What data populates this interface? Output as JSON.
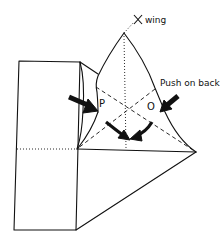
{
  "diagram": {
    "labels": {
      "x_wing": "X wing",
      "push_on_back": "Push on back",
      "point_p": "P",
      "point_o": "O"
    },
    "line_styles": {
      "solid": "edge",
      "dashed": "valley fold",
      "dotted": "crease / hidden edge"
    },
    "colors": {
      "ink": "#111111",
      "paper": "#ffffff"
    }
  }
}
